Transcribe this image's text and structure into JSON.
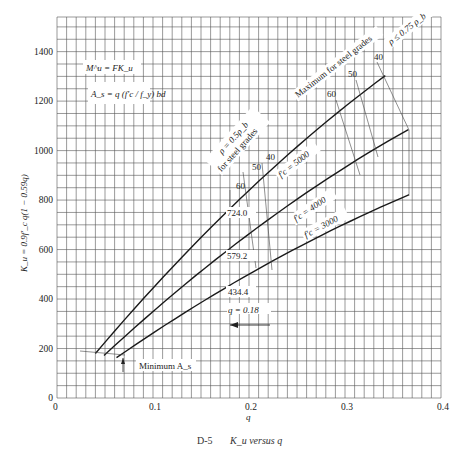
{
  "chart_data": {
    "type": "line",
    "title": "",
    "xlabel": "q",
    "ylabel": "K_u = 0.9f'_c q(1 − 0.59q)",
    "xlim": [
      0,
      0.4
    ],
    "ylim": [
      0,
      1540
    ],
    "grid": true,
    "x_ticks": [
      "0",
      "0.1",
      "0.2",
      "0.3",
      "0.4"
    ],
    "x_tick_values": [
      0,
      0.1,
      0.2,
      0.3,
      0.4
    ],
    "y_ticks": [
      "0",
      "200",
      "400",
      "600",
      "800",
      "1000",
      "1200",
      "1400"
    ],
    "y_tick_values": [
      0,
      200,
      400,
      600,
      800,
      1000,
      1200,
      1400
    ],
    "series": [
      {
        "name": "f'c = 5000",
        "fc": 5000,
        "q_start": 0.04,
        "q_end": 0.342,
        "points": [
          [
            0.04,
            180
          ],
          [
            0.18,
            724.0
          ],
          [
            0.342,
            1303
          ]
        ]
      },
      {
        "name": "f'c = 4000",
        "fc": 4000,
        "q_start": 0.049,
        "q_end": 0.366,
        "points": [
          [
            0.049,
            172
          ],
          [
            0.18,
            579.2
          ],
          [
            0.366,
            1085
          ]
        ]
      },
      {
        "name": "f'c = 3000",
        "fc": 3000,
        "q_start": 0.062,
        "q_end": 0.367,
        "points": [
          [
            0.062,
            163
          ],
          [
            0.18,
            434.4
          ],
          [
            0.367,
            822
          ]
        ]
      }
    ],
    "annotations": {
      "formula1": "M^u = FK_u",
      "formula2": "A_s = q (f'c / f_y) bd",
      "rho_half": "ρ = 0.5ρ_b",
      "rho_half_sub": "for steel grades",
      "rho_max": "ρ ≤ 0.75 ρ_b",
      "rho_max_sub": "Maximum for steel grades",
      "grades_half": [
        "60",
        "50",
        "40"
      ],
      "grades_max": [
        "60",
        "50",
        "40"
      ],
      "values_at_q018": [
        "724.0",
        "579.2",
        "434.4"
      ],
      "q_marker": "q = 0.18",
      "minimum": "Minimum A_s",
      "label_5000": "f'c = 5000",
      "label_4000": "f'c = 4000",
      "label_3000": "f'c = 3000"
    },
    "caption_id": "D-5",
    "caption_text": "K_u versus q"
  }
}
